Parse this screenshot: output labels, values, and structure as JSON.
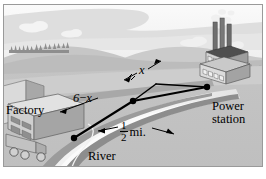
{
  "figure": {
    "type": "illustration-diagram",
    "labels": {
      "factory": "Factory",
      "power_station_line1": "Power",
      "power_station_line2": "station",
      "river": "River",
      "segment_land": "6 − x",
      "segment_land_lhs": "6",
      "segment_land_op": "−",
      "segment_land_rhs": "x",
      "segment_x": "x",
      "river_width_numerator": "1",
      "river_width_denominator": "2",
      "river_width_unit": "mi."
    },
    "colors": {
      "sky": "#f2f2f2",
      "cloud_band": "#dcdcdc",
      "hills_far": "#c9c9c9",
      "hills_near": "#b4b4b4",
      "ground": "#bdbdbd",
      "field_light": "#cfcfcf",
      "river_water": "#e8e8e8",
      "river_bank": "#8f8f8f",
      "building": "#d6d6d6",
      "building_shade": "#9a9a9a",
      "roof_dark": "#4a4a4a",
      "line": "#000000",
      "text": "#000000"
    },
    "geometry": {
      "point_factory": [
        74,
        138
      ],
      "point_bend": [
        133,
        101
      ],
      "point_corner": [
        156,
        84
      ],
      "point_power_station": [
        207,
        87
      ]
    }
  }
}
